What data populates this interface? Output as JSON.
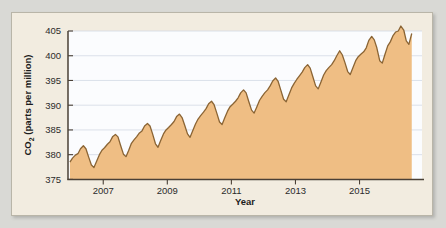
{
  "figure": {
    "panel_bg": "#f2ece0",
    "panel_border": "#b9b5a8",
    "page_bg": "#d9d9d5"
  },
  "chart_data": {
    "type": "area",
    "title": "",
    "xlabel": "Year",
    "ylabel": "CO2 (parts per million)",
    "ylabel_parts": {
      "prefix": "CO",
      "subscript": "2",
      "suffix": " (parts per million)"
    },
    "xlim": [
      2005.9,
      2016.95
    ],
    "ylim": [
      375,
      405
    ],
    "ytick_labels": [
      "375",
      "380",
      "385",
      "390",
      "395",
      "400",
      "405"
    ],
    "ytick_values": [
      375,
      380,
      385,
      390,
      395,
      400,
      405
    ],
    "xtick_labels": [
      "2007",
      "2009",
      "2011",
      "2013",
      "2015"
    ],
    "xtick_values": [
      2007,
      2009,
      2011,
      2013,
      2015
    ],
    "grid": true,
    "grid_axis": "y",
    "grid_color": "#d3d9e4",
    "plot_bg": "#fbfcfe",
    "fill_color": "#efbe84",
    "line_color": "#8a6434",
    "axis_color": "#4a4036",
    "legend": null,
    "series": [
      {
        "name": "Atmospheric CO2 (Mauna Loa, monthly mean)",
        "x": [
          2005.96,
          2006.04,
          2006.13,
          2006.21,
          2006.29,
          2006.38,
          2006.46,
          2006.54,
          2006.63,
          2006.71,
          2006.79,
          2006.88,
          2006.96,
          2007.04,
          2007.13,
          2007.21,
          2007.29,
          2007.38,
          2007.46,
          2007.54,
          2007.63,
          2007.71,
          2007.79,
          2007.88,
          2007.96,
          2008.04,
          2008.13,
          2008.21,
          2008.29,
          2008.38,
          2008.46,
          2008.54,
          2008.63,
          2008.71,
          2008.79,
          2008.88,
          2008.96,
          2009.04,
          2009.13,
          2009.21,
          2009.29,
          2009.38,
          2009.46,
          2009.54,
          2009.63,
          2009.71,
          2009.79,
          2009.88,
          2009.96,
          2010.04,
          2010.13,
          2010.21,
          2010.29,
          2010.38,
          2010.46,
          2010.54,
          2010.63,
          2010.71,
          2010.79,
          2010.88,
          2010.96,
          2011.04,
          2011.13,
          2011.21,
          2011.29,
          2011.38,
          2011.46,
          2011.54,
          2011.63,
          2011.71,
          2011.79,
          2011.88,
          2011.96,
          2012.04,
          2012.13,
          2012.21,
          2012.29,
          2012.38,
          2012.46,
          2012.54,
          2012.63,
          2012.71,
          2012.79,
          2012.88,
          2012.96,
          2013.04,
          2013.13,
          2013.21,
          2013.29,
          2013.38,
          2013.46,
          2013.54,
          2013.63,
          2013.71,
          2013.79,
          2013.88,
          2013.96,
          2014.04,
          2014.13,
          2014.21,
          2014.29,
          2014.38,
          2014.46,
          2014.54,
          2014.63,
          2014.71,
          2014.79,
          2014.88,
          2014.96,
          2015.04,
          2015.13,
          2015.21,
          2015.29,
          2015.38,
          2015.46,
          2015.54,
          2015.63,
          2015.71,
          2015.79,
          2015.88,
          2015.96,
          2016.04,
          2016.13,
          2016.21,
          2016.29,
          2016.38,
          2016.46,
          2016.54,
          2016.63
        ],
        "y": [
          378.5,
          379.3,
          379.9,
          380.2,
          381.2,
          381.8,
          381.2,
          379.6,
          377.9,
          377.4,
          378.6,
          380.0,
          380.9,
          381.4,
          382.1,
          382.6,
          383.6,
          384.1,
          383.6,
          381.9,
          380.1,
          379.6,
          380.8,
          382.3,
          383.0,
          383.6,
          384.4,
          384.8,
          385.8,
          386.3,
          385.8,
          384.2,
          382.2,
          381.5,
          382.8,
          384.2,
          385.0,
          385.5,
          386.1,
          386.7,
          387.7,
          388.2,
          387.5,
          386.0,
          384.2,
          383.5,
          384.8,
          386.2,
          387.2,
          387.9,
          388.6,
          389.3,
          390.3,
          390.8,
          390.1,
          388.5,
          386.6,
          386.1,
          387.4,
          388.8,
          389.7,
          390.2,
          390.8,
          391.5,
          392.5,
          393.1,
          392.5,
          390.8,
          389.0,
          388.4,
          389.6,
          391.0,
          391.8,
          392.5,
          393.1,
          393.9,
          394.9,
          395.5,
          394.8,
          393.1,
          391.2,
          390.7,
          392.0,
          393.5,
          394.4,
          395.2,
          396.0,
          396.7,
          397.6,
          398.2,
          397.5,
          395.8,
          393.9,
          393.3,
          394.6,
          396.1,
          397.0,
          397.6,
          398.2,
          399.0,
          400.0,
          401.0,
          400.2,
          398.7,
          396.8,
          396.2,
          397.5,
          399.0,
          399.8,
          400.3,
          400.8,
          401.6,
          403.1,
          403.9,
          403.2,
          401.6,
          399.0,
          398.5,
          400.2,
          402.0,
          402.8,
          404.0,
          404.8,
          405.0,
          406.0,
          405.2,
          403.0,
          402.3,
          404.5
        ]
      }
    ]
  }
}
